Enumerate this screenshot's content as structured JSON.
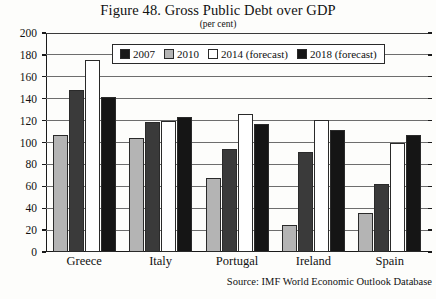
{
  "title": "Figure 48. Gross Public Debt over GDP",
  "subtitle": "(per cent)",
  "source": "Source: IMF World Economic Outlook Database",
  "legend": {
    "items": [
      {
        "label": "2007",
        "key": "s2007",
        "color": "#1a1a1a"
      },
      {
        "label": "2010",
        "key": "s2010",
        "color": "#b4b4b4"
      },
      {
        "label": "2014 (forecast)",
        "key": "s2014",
        "color": "#ffffff"
      },
      {
        "label": "2018 (forecast)",
        "key": "s2018",
        "color": "#151515"
      }
    ]
  },
  "axis": {
    "y_ticks": [
      "200",
      "180",
      "160",
      "140",
      "120",
      "100",
      "80",
      "60",
      "40",
      "20",
      "0"
    ]
  },
  "chart_data": {
    "type": "bar",
    "title": "Figure 48. Gross Public Debt over GDP",
    "subtitle": "(per cent)",
    "xlabel": "",
    "ylabel": "per cent",
    "ylim": [
      0,
      200
    ],
    "ytick_step": 20,
    "grid": true,
    "legend_position": "top-center-inside",
    "categories": [
      "Greece",
      "Italy",
      "Portugal",
      "Ireland",
      "Spain"
    ],
    "series": [
      {
        "name": "2007",
        "values": [
          107,
          104,
          68,
          25,
          36
        ]
      },
      {
        "name": "2010",
        "values": [
          148,
          119,
          94,
          91,
          62
        ]
      },
      {
        "name": "2014 (forecast)",
        "values": [
          175,
          120,
          126,
          121,
          100
        ]
      },
      {
        "name": "2018 (forecast)",
        "values": [
          142,
          123,
          117,
          111,
          107
        ]
      }
    ],
    "source": "Source: IMF World Economic Outlook Database"
  }
}
